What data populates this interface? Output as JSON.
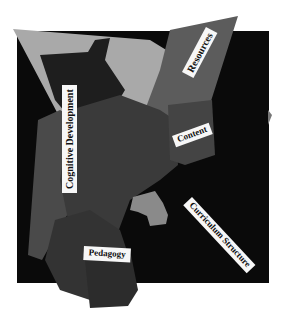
{
  "collage": {
    "labels": {
      "resources": "Resources",
      "content": "Content",
      "cognitive": "Cognitive Development",
      "curriculum": "Curriculum Structure",
      "pedagogy": "Pedagogy"
    },
    "colors": {
      "background": "#ffffff",
      "black_square": "#0a0a0a",
      "light_grey": "#a9a9a9",
      "mid_grey": "#5a5a5a",
      "dark_grey": "#3a3a3a",
      "darker_grey": "#2a2a2a",
      "blob_grey": "#8a8a8a",
      "label_bg": "#f7f7f7"
    }
  }
}
